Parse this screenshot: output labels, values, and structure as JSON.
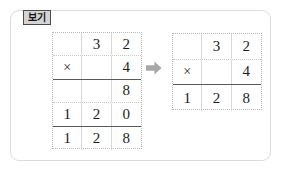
{
  "panel": {
    "label": "보기",
    "border_color": "#dcdcdc",
    "background": "#ffffff"
  },
  "label_tab": {
    "text": "보기",
    "background": "#d4d4d4",
    "border_color": "#4a4a4a",
    "text_color": "#141414"
  },
  "arrow": {
    "icon": "arrow-right-icon",
    "color": "#a6a6a6",
    "direction": "right"
  },
  "problem": {
    "expression": "32 × 4 = 128",
    "multiplicand": "32",
    "multiplier": "4",
    "product": "128",
    "partial_products": [
      "8",
      "120"
    ]
  },
  "left_grid": {
    "name": "expanded-multiplication-grid",
    "columns": 3,
    "rows": [
      {
        "cells": [
          "",
          "3",
          "2"
        ],
        "rule": "dotted"
      },
      {
        "cells": [
          "×",
          "",
          "4"
        ],
        "rule": "solid"
      },
      {
        "cells": [
          "",
          "",
          "8"
        ],
        "rule": "dotted"
      },
      {
        "cells": [
          "1",
          "2",
          "0"
        ],
        "rule": "solid"
      },
      {
        "cells": [
          "1",
          "2",
          "8"
        ],
        "rule": "none"
      }
    ]
  },
  "right_grid": {
    "name": "compact-multiplication-grid",
    "columns": 3,
    "rows": [
      {
        "cells": [
          "",
          "3",
          "2"
        ],
        "rule": "dotted"
      },
      {
        "cells": [
          "×",
          "",
          "4"
        ],
        "rule": "solid"
      },
      {
        "cells": [
          "1",
          "2",
          "8"
        ],
        "rule": "none"
      }
    ]
  }
}
